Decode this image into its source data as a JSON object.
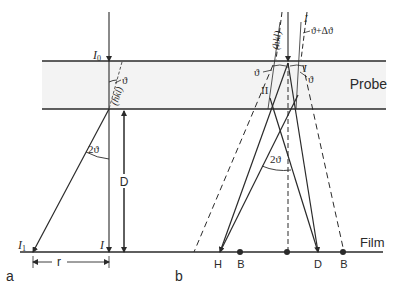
{
  "diagram": {
    "colors": {
      "line": "#2a2a2a",
      "probe_fill": "#f3f3f3",
      "background": "#ffffff"
    },
    "probe_label": "Probe",
    "film_label": "Film",
    "panel_a": {
      "panel_label": "a",
      "incident_intensity": "I",
      "incident_subscript": "0",
      "angle_theta": "ϑ",
      "plane_label": "(hkl)",
      "angle_two_theta": "2ϑ",
      "distance_label": "D",
      "diffracted_intensity": "I",
      "diffracted_subscript": "1",
      "transmitted_intensity": "I",
      "radius_label": "r"
    },
    "panel_b": {
      "panel_label": "b",
      "plane_label": "(hkl)",
      "plane_label_right": "I",
      "angle_theta_delta": "ϑ+Δϑ",
      "angle_theta_left": "ϑ",
      "angle_theta_right": "ϑ",
      "intensity_right": "I",
      "region_label": "II",
      "angle_two_theta": "2ϑ",
      "film_markers": [
        "H",
        "B",
        "D",
        "B"
      ]
    }
  }
}
